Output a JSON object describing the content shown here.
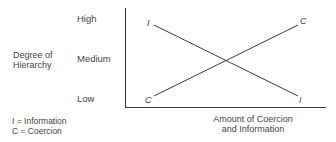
{
  "diagram": {
    "y_axis": {
      "title_line1": "Degree of",
      "title_line2": "Hierarchy",
      "ticks": [
        "High",
        "Medium",
        "Low"
      ]
    },
    "x_axis": {
      "title_line1": "Amount of Coercion",
      "title_line2": "and Information"
    },
    "lines": [
      {
        "name": "Information",
        "marker": "I",
        "start": "High",
        "end": "Low",
        "trend": "decreasing"
      },
      {
        "name": "Coercion",
        "marker": "C",
        "start": "Low",
        "end": "High",
        "trend": "increasing"
      }
    ],
    "markers": {
      "I_start": "I",
      "I_end": "I",
      "C_start": "C",
      "C_end": "C"
    },
    "legend": {
      "line1": "I = Information",
      "line2": "C = Coercion"
    },
    "colors": {
      "line": "#3c3c3c",
      "text": "#444444"
    }
  }
}
